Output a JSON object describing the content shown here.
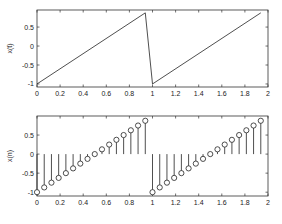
{
  "figure": {
    "background": "#ffffff",
    "axis_color": "#333333",
    "line_color": "#222222"
  },
  "chart_data": [
    {
      "type": "line",
      "title": "",
      "xlabel": "",
      "ylabel": "x(t)",
      "xlim": [
        0,
        2
      ],
      "ylim": [
        -1.08,
        0.95
      ],
      "xticks": [
        0,
        0.2,
        0.4,
        0.6,
        0.8,
        1,
        1.2,
        1.4,
        1.6,
        1.8,
        2
      ],
      "xtick_labels": [
        "0",
        "0.2",
        "0.4",
        "0.6",
        "0.8",
        "1",
        "1.2",
        "1.4",
        "1.6",
        "1.8",
        "2"
      ],
      "yticks": [
        -1,
        -0.5,
        0,
        0.5
      ],
      "ytick_labels": [
        "-1",
        "-0.5",
        "0",
        "0.5"
      ],
      "grid": false,
      "legend": null,
      "series": [
        {
          "name": "x(t) sawtooth",
          "x": [
            0,
            0.9375,
            1.0,
            1.9375
          ],
          "y": [
            -1,
            0.875,
            -1,
            0.875
          ]
        }
      ],
      "box": {
        "left": 37,
        "top": 10,
        "right": 268,
        "bottom": 87
      }
    },
    {
      "type": "stem",
      "title": "",
      "xlabel": "",
      "ylabel": "x(n)",
      "xlim": [
        0,
        2
      ],
      "ylim": [
        -1.1,
        1.0
      ],
      "xticks": [
        0,
        0.2,
        0.4,
        0.6,
        0.8,
        1,
        1.2,
        1.4,
        1.6,
        1.8,
        2
      ],
      "xtick_labels": [
        "0",
        "0.2",
        "0.4",
        "0.6",
        "0.8",
        "1",
        "1.2",
        "1.4",
        "1.6",
        "1.8",
        "2"
      ],
      "yticks": [
        -1,
        -0.5,
        0,
        0.5
      ],
      "ytick_labels": [
        "-1",
        "-0.5",
        "0",
        "0.5"
      ],
      "grid": false,
      "legend": null,
      "series": [
        {
          "name": "x(n) samples",
          "x": [
            0,
            0.0625,
            0.125,
            0.1875,
            0.25,
            0.3125,
            0.375,
            0.4375,
            0.5,
            0.5625,
            0.625,
            0.6875,
            0.75,
            0.8125,
            0.875,
            0.9375,
            1.0,
            1.0625,
            1.125,
            1.1875,
            1.25,
            1.3125,
            1.375,
            1.4375,
            1.5,
            1.5625,
            1.625,
            1.6875,
            1.75,
            1.8125,
            1.875,
            1.9375
          ],
          "y": [
            -1,
            -0.875,
            -0.75,
            -0.625,
            -0.5,
            -0.375,
            -0.25,
            -0.125,
            0,
            0.125,
            0.25,
            0.375,
            0.5,
            0.625,
            0.75,
            0.875,
            -1,
            -0.875,
            -0.75,
            -0.625,
            -0.5,
            -0.375,
            -0.25,
            -0.125,
            0,
            0.125,
            0.25,
            0.375,
            0.5,
            0.625,
            0.75,
            0.875
          ]
        }
      ],
      "box": {
        "left": 37,
        "top": 116,
        "right": 268,
        "bottom": 196
      }
    }
  ]
}
